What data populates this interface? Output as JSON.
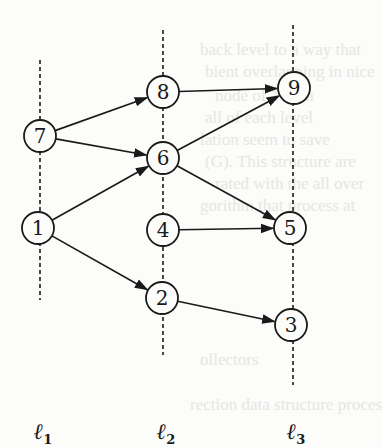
{
  "diagram": {
    "type": "layered directed graph",
    "levels": [
      {
        "id": "l1",
        "label": "ℓ",
        "subscript": "1",
        "x": 40,
        "line_y": [
          60,
          300
        ]
      },
      {
        "id": "l2",
        "label": "ℓ",
        "subscript": "2",
        "x": 163,
        "line_y": [
          30,
          355
        ]
      },
      {
        "id": "l3",
        "label": "ℓ",
        "subscript": "3",
        "x": 293,
        "line_y": [
          25,
          385
        ]
      }
    ],
    "nodes": [
      {
        "id": "7",
        "label": "7",
        "level": "l1",
        "x": 40,
        "y": 136
      },
      {
        "id": "1",
        "label": "1",
        "level": "l1",
        "x": 38,
        "y": 228
      },
      {
        "id": "8",
        "label": "8",
        "level": "l2",
        "x": 163,
        "y": 92
      },
      {
        "id": "6",
        "label": "6",
        "level": "l2",
        "x": 163,
        "y": 158
      },
      {
        "id": "4",
        "label": "4",
        "level": "l2",
        "x": 163,
        "y": 230
      },
      {
        "id": "2",
        "label": "2",
        "level": "l2",
        "x": 162,
        "y": 298
      },
      {
        "id": "9",
        "label": "9",
        "level": "l3",
        "x": 294,
        "y": 88
      },
      {
        "id": "5",
        "label": "5",
        "level": "l3",
        "x": 290,
        "y": 228
      },
      {
        "id": "3",
        "label": "3",
        "level": "l3",
        "x": 291,
        "y": 325
      }
    ],
    "edges": [
      {
        "from": "7",
        "to": "8"
      },
      {
        "from": "7",
        "to": "6"
      },
      {
        "from": "1",
        "to": "6"
      },
      {
        "from": "1",
        "to": "2"
      },
      {
        "from": "8",
        "to": "9"
      },
      {
        "from": "6",
        "to": "9"
      },
      {
        "from": "6",
        "to": "5"
      },
      {
        "from": "4",
        "to": "5"
      },
      {
        "from": "2",
        "to": "3"
      }
    ],
    "node_radius": 16,
    "stroke_color": "#1a1a1a",
    "background_color": "#fcfcfa"
  },
  "bleed_through_text": [
    "back level to a way that",
    "bient overlapping in nice",
    "node of 1 with",
    "all of each level",
    "lation seem to save",
    "(G). This structure are",
    "rated with the all over",
    "gorithm that process at",
    "ollectors",
    "rection data structure proces"
  ]
}
